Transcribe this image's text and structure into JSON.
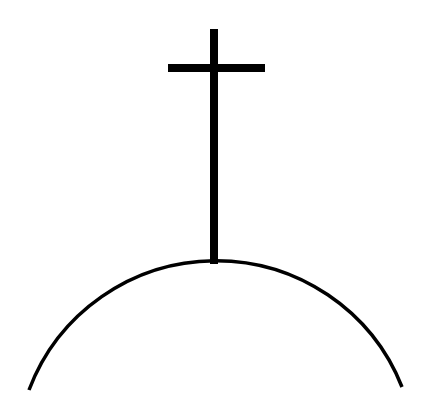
{
  "drawing": {
    "description": "Line drawing of a cross standing on top of a hill (dome arc)",
    "elements": [
      "cross",
      "hill-arc"
    ],
    "colors": {
      "background": "#ffffff",
      "stroke": "#000000"
    }
  }
}
